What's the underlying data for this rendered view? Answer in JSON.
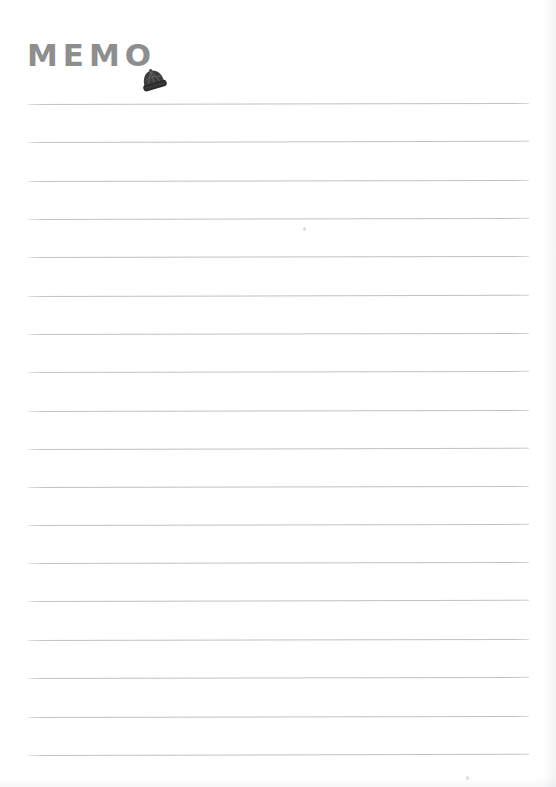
{
  "document": {
    "type": "memo-notepad-page",
    "title": "MEMO",
    "paper_color": "#ffffff",
    "title_color": "#8e8e8e",
    "rule_color": "#b9bdc1"
  },
  "header": {
    "title_text": "MEMO",
    "icon_name": "beanie-hat-icon",
    "icon_color": "#3a3a3a"
  },
  "body": {
    "line_count": 18,
    "lines": [
      {
        "index": 1,
        "y": 104,
        "slant_deg": -0.12,
        "content": ""
      },
      {
        "index": 2,
        "y": 142,
        "slant_deg": -0.14,
        "content": ""
      },
      {
        "index": 3,
        "y": 181,
        "slant_deg": -0.12,
        "content": ""
      },
      {
        "index": 4,
        "y": 219,
        "slant_deg": -0.13,
        "content": ""
      },
      {
        "index": 5,
        "y": 257,
        "slant_deg": -0.12,
        "content": ""
      },
      {
        "index": 6,
        "y": 296,
        "slant_deg": -0.14,
        "content": ""
      },
      {
        "index": 7,
        "y": 334,
        "slant_deg": -0.12,
        "content": ""
      },
      {
        "index": 8,
        "y": 372,
        "slant_deg": -0.13,
        "content": ""
      },
      {
        "index": 9,
        "y": 411,
        "slant_deg": -0.12,
        "content": ""
      },
      {
        "index": 10,
        "y": 449,
        "slant_deg": -0.14,
        "content": ""
      },
      {
        "index": 11,
        "y": 487,
        "slant_deg": -0.12,
        "content": ""
      },
      {
        "index": 12,
        "y": 525,
        "slant_deg": -0.13,
        "content": ""
      },
      {
        "index": 13,
        "y": 563,
        "slant_deg": -0.12,
        "content": ""
      },
      {
        "index": 14,
        "y": 601,
        "slant_deg": -0.14,
        "content": ""
      },
      {
        "index": 15,
        "y": 640,
        "slant_deg": -0.12,
        "content": ""
      },
      {
        "index": 16,
        "y": 678,
        "slant_deg": -0.13,
        "content": ""
      },
      {
        "index": 17,
        "y": 717,
        "slant_deg": -0.12,
        "content": ""
      },
      {
        "index": 18,
        "y": 755,
        "slant_deg": -0.14,
        "content": ""
      }
    ],
    "specks": [
      {
        "x": 303,
        "y": 227
      },
      {
        "x": 466,
        "y": 776
      }
    ]
  }
}
